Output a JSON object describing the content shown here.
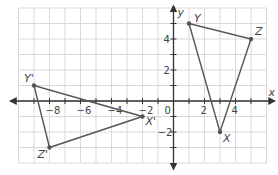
{
  "figure": {
    "type": "coordinate-plane-reflection",
    "x_axis_label": "x",
    "y_axis_label": "y",
    "x_ticks": [
      {
        "value": -8,
        "label": "−8"
      },
      {
        "value": -6,
        "label": "−6"
      },
      {
        "value": -4,
        "label": "−4"
      },
      {
        "value": -2,
        "label": "−2"
      },
      {
        "value": 0,
        "label": "0"
      },
      {
        "value": 2,
        "label": "2"
      },
      {
        "value": 4,
        "label": "4"
      }
    ],
    "y_ticks": [
      {
        "value": 4,
        "label": "4"
      },
      {
        "value": 2,
        "label": "2"
      },
      {
        "value": -2,
        "label": "−2"
      }
    ],
    "grid": {
      "xmin": -10,
      "xmax": 6,
      "ymin": -4,
      "ymax": 6
    },
    "colors": {
      "grid": "#d9d9d9",
      "axis": "#333333",
      "shape": "#555555",
      "point": "#555555"
    }
  },
  "triangles": [
    {
      "name": "XYZ",
      "vertices": [
        {
          "label": "X",
          "x": 3,
          "y": -2
        },
        {
          "label": "Y",
          "x": 1,
          "y": 5
        },
        {
          "label": "Z",
          "x": 5,
          "y": 4
        }
      ]
    },
    {
      "name": "X'Y'Z'",
      "vertices": [
        {
          "label": "X'",
          "x": -2,
          "y": -1
        },
        {
          "label": "Y'",
          "x": -9,
          "y": 1
        },
        {
          "label": "Z'",
          "x": -8,
          "y": -3
        }
      ]
    }
  ]
}
